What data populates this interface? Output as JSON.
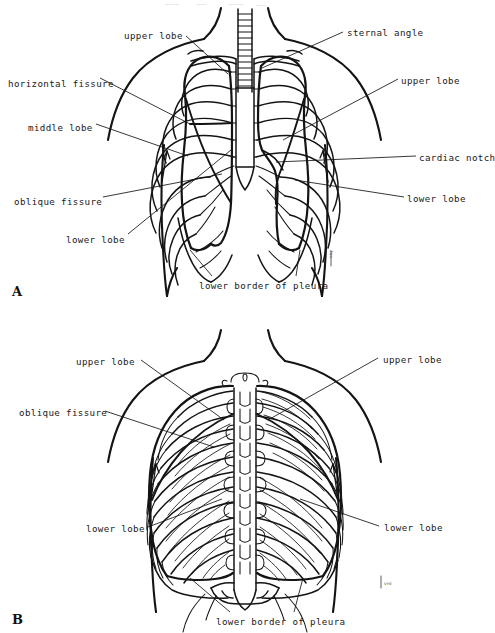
{
  "figure": {
    "type": "anatomical-line-drawing",
    "panels": [
      {
        "id": "A",
        "letter": "A",
        "view": "anterior",
        "labels": [
          {
            "id": "a-upper-lobe-left",
            "text": "upper lobe",
            "x": 124,
            "y": 31,
            "align": "left"
          },
          {
            "id": "a-sternal-angle",
            "text": "sternal angle",
            "x": 347,
            "y": 28,
            "align": "left"
          },
          {
            "id": "a-horizontal-fissure",
            "text": "horizontal fissure",
            "x": 8,
            "y": 79,
            "align": "left"
          },
          {
            "id": "a-upper-lobe-right",
            "text": "upper lobe",
            "x": 401,
            "y": 76,
            "align": "left"
          },
          {
            "id": "a-middle-lobe",
            "text": "middle lobe",
            "x": 28,
            "y": 123,
            "align": "left"
          },
          {
            "id": "a-cardiac-notch",
            "text": "cardiac notch",
            "x": 419,
            "y": 153,
            "align": "left"
          },
          {
            "id": "a-oblique-fissure",
            "text": "oblique fissure",
            "x": 14,
            "y": 197,
            "align": "left"
          },
          {
            "id": "a-lower-lobe-right",
            "text": "lower lobe",
            "x": 407,
            "y": 194,
            "align": "left"
          },
          {
            "id": "a-lower-lobe-left",
            "text": "lower lobe",
            "x": 66,
            "y": 235,
            "align": "left"
          },
          {
            "id": "a-lower-border",
            "text": "lower border of pleura",
            "x": 199,
            "y": 281,
            "align": "left"
          }
        ],
        "signature": {
          "text": "VHE",
          "x": 330,
          "y": 258
        }
      },
      {
        "id": "B",
        "letter": "B",
        "view": "posterior",
        "labels": [
          {
            "id": "b-upper-lobe-left",
            "text": "upper lobe",
            "x": 76,
            "y": 357,
            "align": "left"
          },
          {
            "id": "b-upper-lobe-right",
            "text": "upper lobe",
            "x": 383,
            "y": 355,
            "align": "left"
          },
          {
            "id": "b-oblique-fissure",
            "text": "oblique fissure",
            "x": 19,
            "y": 408,
            "align": "left"
          },
          {
            "id": "b-lower-lobe-left",
            "text": "lower lobe",
            "x": 86,
            "y": 524,
            "align": "left"
          },
          {
            "id": "b-lower-lobe-right",
            "text": "lower lobe",
            "x": 384,
            "y": 523,
            "align": "left"
          },
          {
            "id": "b-lower-border",
            "text": "lower border of pleura",
            "x": 216,
            "y": 617,
            "align": "left"
          }
        ],
        "signature": {
          "text": "VHE",
          "x": 384,
          "y": 583
        }
      }
    ],
    "colors": {
      "ink": "#141414",
      "background": "#ffffff",
      "text": "#1a1a1a",
      "signature": "#4a4a4a"
    }
  }
}
